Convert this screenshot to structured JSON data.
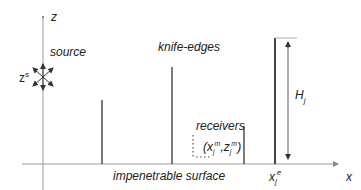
{
  "diagram": {
    "axes": {
      "z_label": "z",
      "x_label": "x"
    },
    "source": {
      "label": "source",
      "height_label_base": "z",
      "height_label_sup": "s"
    },
    "knife_edges": {
      "label": "knife-edges",
      "edges": [
        {
          "x": 102,
          "top": 100
        },
        {
          "x": 172,
          "top": 67
        },
        {
          "x": 244,
          "top": 126
        },
        {
          "x": 275,
          "top": 38
        }
      ]
    },
    "receivers": {
      "label": "receivers",
      "coord_open": "(",
      "coord_x": "x",
      "coord_x_sub": "j",
      "coord_x_sup": "m",
      "coord_comma": ",",
      "coord_z": "z",
      "coord_z_sub": "j",
      "coord_z_sup": "m",
      "coord_close": ")"
    },
    "surface": {
      "label": "impenetrable surface"
    },
    "height_marker": {
      "label_base": "H",
      "label_sub": "j"
    },
    "edge_position": {
      "label_base": "x",
      "label_sub": "j",
      "label_sup": "e"
    },
    "colors": {
      "axis": "#9a9a9a",
      "edge": "#333333",
      "text": "#222222"
    }
  }
}
